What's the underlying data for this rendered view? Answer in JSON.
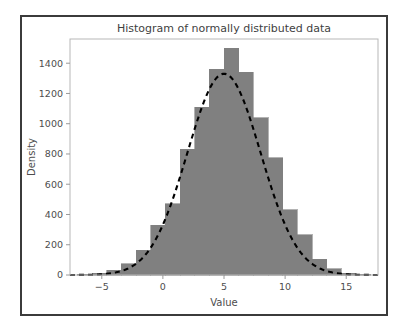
{
  "figure": {
    "background_color": "#ffffff",
    "border_color": "#3b3b3b",
    "plot_border_color": "#b7b7b7"
  },
  "chart_data": {
    "type": "bar",
    "title": "Histogram of normally distributed data",
    "xlabel": "Value",
    "ylabel": "Density",
    "xlim": [
      -7.6,
      17.6
    ],
    "ylim": [
      0,
      1560
    ],
    "xticks": [
      -5,
      0,
      5,
      10,
      15
    ],
    "xtick_labels": [
      "−5",
      "0",
      "5",
      "10",
      "15"
    ],
    "yticks": [
      0,
      200,
      400,
      600,
      800,
      1000,
      1200,
      1400
    ],
    "ytick_labels": [
      "0",
      "200",
      "400",
      "600",
      "800",
      "1000",
      "1200",
      "1400"
    ],
    "grid": false,
    "legend": null,
    "bar_color": "#808080",
    "bar_edge_color": "#808080",
    "bin_width": 1.2,
    "bin_edges": [
      -7.0,
      -5.8,
      -4.6,
      -3.4,
      -2.2,
      -1.0,
      0.2,
      1.4,
      2.6,
      3.8,
      5.0,
      6.2,
      7.4,
      8.6,
      9.8,
      11.0,
      12.2,
      13.4,
      14.6,
      15.8,
      17.0
    ],
    "bin_centers": [
      -6.4,
      -5.2,
      -4.0,
      -2.8,
      -1.6,
      -0.4,
      0.8,
      2.0,
      3.2,
      4.4,
      5.6,
      6.8,
      8.0,
      9.2,
      10.4,
      11.6,
      12.8,
      14.0,
      15.2,
      16.4
    ],
    "values": [
      5,
      12,
      30,
      75,
      165,
      330,
      470,
      830,
      1110,
      1360,
      1500,
      1340,
      1040,
      775,
      430,
      265,
      105,
      40,
      12,
      4
    ],
    "overlay": {
      "name": "normal-density-curve",
      "style": "dashed",
      "color": "#000000",
      "mean": 5.0,
      "sigma": 3.0,
      "peak": 1330
    }
  }
}
